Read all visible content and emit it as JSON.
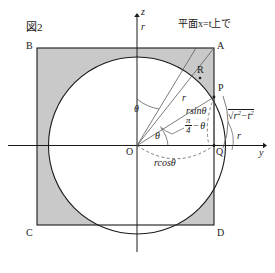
{
  "figure": {
    "title": "図2",
    "caption_plane": "平面x=t上で",
    "type": "geometry-diagram"
  },
  "axes": {
    "vertical_label": "z",
    "horizontal_label": "y",
    "origin_label": "O",
    "z_tick_label": "r",
    "y_tick_label": "r"
  },
  "points": {
    "A": "A",
    "B": "B",
    "C": "C",
    "D": "D",
    "P": "P",
    "Q": "Q",
    "R": "R",
    "O": "O"
  },
  "angles": {
    "theta_from_z": "θ",
    "theta_from_y": "θ",
    "pi_over_4_minus_theta": {
      "numerator": "π",
      "denominator": "4",
      "minus": "−",
      "theta": "θ"
    }
  },
  "segments": {
    "radius": "r",
    "r_sin_theta": "rsinθ",
    "r_cos_theta": "rcosθ",
    "sqrt_r2_minus_t2": {
      "radical": "√",
      "r": "r",
      "r_exp": "2",
      "minus": "−",
      "t": "t",
      "t_exp": "2"
    }
  },
  "colors": {
    "stroke": "#1a1a1a",
    "thin_stroke": "#4a4a4a",
    "shade_fill": "#c9c9c9",
    "background": "#ffffff"
  }
}
